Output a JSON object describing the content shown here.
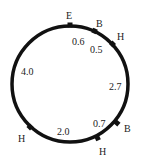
{
  "diagram": {
    "type": "circular-route",
    "colors": {
      "stroke": "#111111",
      "text": "#222222",
      "background": "#ffffff"
    },
    "points": [
      {
        "label": "E",
        "angle_deg": 90
      },
      {
        "label": "B",
        "angle_deg": 64
      },
      {
        "label": "H",
        "angle_deg": 42
      },
      {
        "label": "B",
        "angle_deg": -40
      },
      {
        "label": "H",
        "angle_deg": -67
      },
      {
        "label": "H",
        "angle_deg": -136
      }
    ],
    "segments": [
      {
        "from": "E",
        "to": "B",
        "length": "0.6"
      },
      {
        "from": "B",
        "to": "H",
        "length": "0.5"
      },
      {
        "from": "H",
        "to": "B",
        "length": "2.7"
      },
      {
        "from": "B",
        "to": "H",
        "length": "0.7"
      },
      {
        "from": "H",
        "to": "H",
        "length": "2.0"
      },
      {
        "from": "H",
        "to": "E",
        "length": "4.0"
      }
    ]
  }
}
